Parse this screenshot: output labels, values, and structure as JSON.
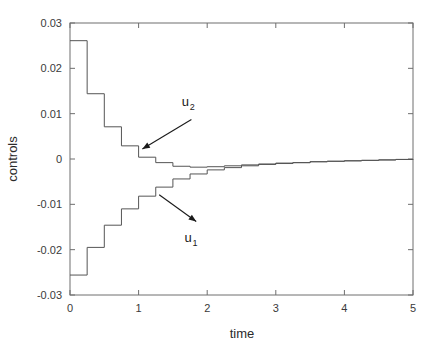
{
  "chart_data": {
    "type": "line",
    "title": "",
    "xlabel": "time",
    "ylabel": "controls",
    "xlim": [
      0,
      5
    ],
    "ylim": [
      -0.03,
      0.03
    ],
    "xticks": [
      0,
      1,
      2,
      3,
      4,
      5
    ],
    "xticklabels": [
      "0",
      "1",
      "2",
      "3",
      "4",
      "5"
    ],
    "yticks": [
      0.03,
      0.02,
      0.01,
      0,
      -0.01,
      -0.02,
      -0.03
    ],
    "yticklabels": [
      "0.03",
      "0.02",
      "0.01",
      "0",
      "-0.01",
      "-0.02",
      "-0.03"
    ],
    "grid": false,
    "legend": "none",
    "drawstyle": "steps-post",
    "step_width": 0.25,
    "line_color": "#555555",
    "series": [
      {
        "name": "u_2",
        "label": "u",
        "subscript": "2",
        "x": [
          0,
          0.25,
          0.5,
          0.75,
          1.0,
          1.25,
          1.5,
          1.75,
          2.0,
          2.25,
          2.5,
          2.75,
          3.0,
          3.25,
          3.5,
          3.75,
          4.0,
          4.25,
          4.5,
          4.75,
          5.0
        ],
        "values": [
          0.0261,
          0.0144,
          0.0071,
          0.0029,
          0.0004,
          -0.0008,
          -0.0016,
          -0.0018,
          -0.0017,
          -0.0015,
          -0.0013,
          -0.0011,
          -0.0009,
          -0.0008,
          -0.0006,
          -0.0005,
          -0.0004,
          -0.0003,
          -0.0002,
          -0.0001,
          0.0
        ]
      },
      {
        "name": "u_1",
        "label": "u",
        "subscript": "1",
        "x": [
          0,
          0.25,
          0.5,
          0.75,
          1.0,
          1.25,
          1.5,
          1.75,
          2.0,
          2.25,
          2.5,
          2.75,
          3.0,
          3.25,
          3.5,
          3.75,
          4.0,
          4.25,
          4.5,
          4.75,
          5.0
        ],
        "values": [
          -0.0256,
          -0.0195,
          -0.0146,
          -0.011,
          -0.0082,
          -0.0062,
          -0.0044,
          -0.0033,
          -0.0024,
          -0.0019,
          -0.0015,
          -0.0012,
          -0.001,
          -0.0008,
          -0.0006,
          -0.0005,
          -0.0004,
          -0.0003,
          -0.0002,
          -0.0001,
          0.0
        ]
      }
    ],
    "annotations": [
      {
        "name": "u2-annotation",
        "text": "u",
        "subscript": "2",
        "label_x": 1.63,
        "label_y": 0.0118,
        "arrow_from_x": 1.77,
        "arrow_from_y": 0.0087,
        "arrow_to_x": 1.055,
        "arrow_to_y": 0.0022
      },
      {
        "name": "u1-annotation",
        "text": "u",
        "subscript": "1",
        "label_x": 1.67,
        "label_y": -0.0182,
        "arrow_from_x": 1.3,
        "arrow_from_y": -0.0079,
        "arrow_to_x": 1.84,
        "arrow_to_y": -0.0138
      }
    ]
  },
  "axes": {
    "frame_color": "#6e6e6e",
    "background": "#ffffff"
  }
}
